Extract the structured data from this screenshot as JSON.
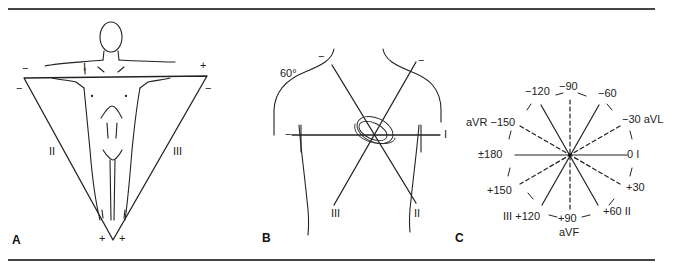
{
  "figure": {
    "panels": [
      {
        "id": "A",
        "letter": "A",
        "title": "Einthoven triangle on body",
        "leads": {
          "lead_i": "I",
          "lead_ii": "II",
          "lead_iii": "III"
        },
        "polarity": {
          "top_left_1": "−",
          "top_left_2": "−",
          "top_right_plus": "+",
          "top_right_minus": "−",
          "bottom_left_plus": "+",
          "bottom_right_plus": "+"
        }
      },
      {
        "id": "B",
        "letter": "B",
        "title": "Limb leads crossing the heart",
        "angle_label": "60°",
        "leads": {
          "lead_i": "I",
          "lead_ii": "II",
          "lead_iii": "III"
        },
        "polarity": {
          "lead_ii_minus": "−",
          "lead_iii_minus": "−",
          "lead_i_minus": "−"
        }
      },
      {
        "id": "C",
        "letter": "C",
        "title": "Hexaxial reference system",
        "axis_labels": {
          "m90": "−90",
          "m60": "−60",
          "m120": "−120",
          "m30_avl": "−30 aVL",
          "avr_m150": "aVR −150",
          "zero_i": "0 I",
          "pm180": "±180",
          "p30": "+30",
          "p150": "+150",
          "p60_ii": "+60 II",
          "iii_p120": "III +120",
          "p90": "+90",
          "avf": "aVF"
        },
        "solid_axes": [
          "I (0/±180)",
          "II (+60/−120)",
          "III (+120/−60)"
        ],
        "dashed_axes": [
          "aVF (+90/−90)",
          "aVL (−30/+150)",
          "aVR (−150/+30)"
        ]
      }
    ],
    "colors": {
      "ink": "#222222",
      "rule": "#444444",
      "background": "#ffffff"
    }
  }
}
